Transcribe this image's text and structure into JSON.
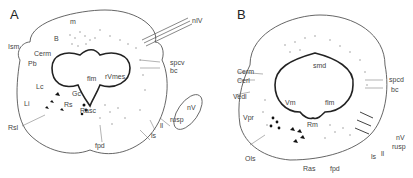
{
  "panels": [
    {
      "letter": "A",
      "labels": {
        "m": "m",
        "nIV": "nIV",
        "B": "B",
        "Ism": "Ism",
        "Cerm": "Cerm",
        "Pb": "Pb",
        "spcv": "spcv",
        "bc": "bc",
        "flm": "flm",
        "rVmes": "rVmes",
        "Lc": "Lc",
        "Gc": "Gc",
        "Li": "Li",
        "Rs": "Rs",
        "Rasc": "Rasc",
        "nV": "nV",
        "rusp": "rusp",
        "ll": "ll",
        "Rsl": "Rsl",
        "ls": "ls",
        "fpd": "fpd"
      }
    },
    {
      "letter": "B",
      "labels": {
        "smd": "smd",
        "Cerm": "Cerm",
        "Cerl": "Cerl",
        "spcd": "spcd",
        "bc": "bc",
        "Vedl": "Vedl",
        "Vm": "Vm",
        "flm": "flm",
        "Vpr": "Vpr",
        "Rm": "Rm",
        "nV": "nV",
        "rusp": "rusp",
        "ll": "ll",
        "ls": "ls",
        "Ols": "Ols",
        "Ras": "Ras",
        "fpd": "fpd"
      }
    }
  ]
}
